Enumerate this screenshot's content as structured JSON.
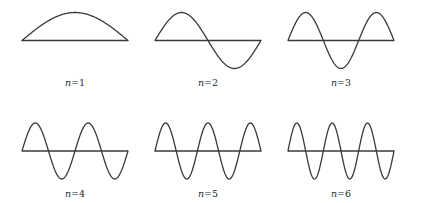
{
  "diagram": {
    "line_color": "#3a3a3a",
    "label_color": "#2a2a2a",
    "background": "#ffffff",
    "modes": [
      {
        "n": 1,
        "label_var": "n",
        "label_eq": "=1",
        "half_wavelengths": 1
      },
      {
        "n": 2,
        "label_var": "n",
        "label_eq": "=2",
        "half_wavelengths": 2
      },
      {
        "n": 3,
        "label_var": "n",
        "label_eq": "=3",
        "half_wavelengths": 3
      },
      {
        "n": 4,
        "label_var": "n",
        "label_eq": "=4",
        "half_wavelengths": 4
      },
      {
        "n": 5,
        "label_var": "n",
        "label_eq": "=5",
        "half_wavelengths": 5
      },
      {
        "n": 6,
        "label_var": "n",
        "label_eq": "=6",
        "half_wavelengths": 6
      }
    ]
  }
}
